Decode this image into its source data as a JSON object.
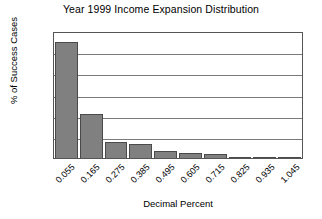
{
  "chart_data": {
    "type": "bar",
    "title": "Year 1999 Income Expansion Distribution",
    "xlabel": "Decimal Percent",
    "ylabel": "% of Success Cases",
    "categories": [
      "0.055",
      "0.165",
      "0.275",
      "0.385",
      "0.495",
      "0.605",
      "0.715",
      "0.825",
      "0.935",
      "1.045"
    ],
    "values": [
      55,
      21,
      7.5,
      6.5,
      3.5,
      2.5,
      2,
      0.6,
      0.6,
      0.5
    ],
    "ylim": [
      0,
      60
    ],
    "ytick_labels": [
      "0",
      "10",
      "20",
      "30",
      "40",
      "50",
      "60"
    ],
    "ytick_values": [
      0,
      10,
      20,
      30,
      40,
      50,
      60
    ],
    "grid": "horizontal",
    "legend": "none",
    "bar_color": "#808080",
    "bar_edge_color": "#4a4a4a",
    "grid_color": "#7a7a7a",
    "axis_color": "#555555",
    "text_color": "#000000"
  }
}
